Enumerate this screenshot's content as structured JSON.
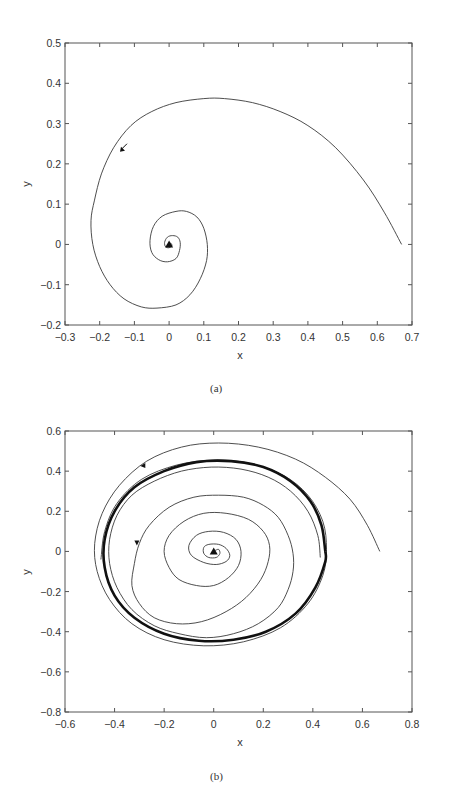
{
  "chart_data": [
    {
      "type": "line",
      "panel": "(a)",
      "title": "",
      "xlabel": "x",
      "ylabel": "y",
      "xlim": [
        -0.3,
        0.7
      ],
      "ylim": [
        -0.2,
        0.5
      ],
      "xticks": [
        -0.3,
        -0.2,
        -0.1,
        0,
        0.1,
        0.2,
        0.3,
        0.4,
        0.5,
        0.6,
        0.7
      ],
      "xtick_labels": [
        "−0.3",
        "−0.2",
        "−0.1",
        "0",
        "0.1",
        "0.2",
        "0.3",
        "0.4",
        "0.5",
        "0.6",
        "0.7"
      ],
      "yticks": [
        -0.2,
        -0.1,
        0,
        0.1,
        0.2,
        0.3,
        0.4,
        0.5
      ],
      "ytick_labels": [
        "−0.2",
        "−0.1",
        "0",
        "0.1",
        "0.2",
        "0.3",
        "0.4",
        "0.5"
      ],
      "grid": false,
      "legend": null,
      "series": [
        {
          "name": "trajectory (spiral to stable focus)",
          "style": "thin",
          "points": [
            [
              0.67,
              0.0
            ],
            [
              0.62,
              0.08
            ],
            [
              0.56,
              0.16
            ],
            [
              0.48,
              0.24
            ],
            [
              0.4,
              0.295
            ],
            [
              0.32,
              0.33
            ],
            [
              0.24,
              0.352
            ],
            [
              0.16,
              0.362
            ],
            [
              0.1,
              0.362
            ],
            [
              0.02,
              0.352
            ],
            [
              -0.05,
              0.33
            ],
            [
              -0.11,
              0.295
            ],
            [
              -0.16,
              0.24
            ],
            [
              -0.195,
              0.175
            ],
            [
              -0.215,
              0.11
            ],
            [
              -0.225,
              0.06
            ],
            [
              -0.22,
              0.0
            ],
            [
              -0.2,
              -0.055
            ],
            [
              -0.17,
              -0.1
            ],
            [
              -0.13,
              -0.135
            ],
            [
              -0.08,
              -0.155
            ],
            [
              -0.035,
              -0.158
            ],
            [
              0.02,
              -0.15
            ],
            [
              0.06,
              -0.125
            ],
            [
              0.09,
              -0.085
            ],
            [
              0.108,
              -0.04
            ],
            [
              0.11,
              0.0
            ],
            [
              0.1,
              0.04
            ],
            [
              0.08,
              0.068
            ],
            [
              0.05,
              0.082
            ],
            [
              0.02,
              0.082
            ],
            [
              -0.02,
              0.07
            ],
            [
              -0.045,
              0.045
            ],
            [
              -0.055,
              0.01
            ],
            [
              -0.05,
              -0.02
            ],
            [
              -0.03,
              -0.038
            ],
            [
              -0.005,
              -0.043
            ],
            [
              0.02,
              -0.035
            ],
            [
              0.03,
              -0.015
            ],
            [
              0.032,
              0.005
            ],
            [
              0.025,
              0.018
            ],
            [
              0.01,
              0.022
            ],
            [
              -0.005,
              0.018
            ],
            [
              -0.013,
              0.005
            ],
            [
              -0.01,
              -0.006
            ],
            [
              0.0,
              -0.008
            ],
            [
              0.008,
              -0.003
            ],
            [
              0.005,
              0.003
            ],
            [
              0.0,
              0.002
            ]
          ]
        }
      ],
      "markers": [
        {
          "type": "arrow",
          "at": [
            -0.13,
            0.24
          ],
          "direction": "down-left"
        },
        {
          "type": "triangle",
          "at": [
            0.0,
            0.0
          ],
          "label": "fixed point"
        }
      ]
    },
    {
      "type": "line",
      "panel": "(b)",
      "title": "",
      "xlabel": "x",
      "ylabel": "y",
      "xlim": [
        -0.6,
        0.8
      ],
      "ylim": [
        -0.8,
        0.6
      ],
      "xticks": [
        -0.6,
        -0.4,
        -0.2,
        0,
        0.2,
        0.4,
        0.6,
        0.8
      ],
      "xtick_labels": [
        "−0.6",
        "−0.4",
        "−0.2",
        "0",
        "0.2",
        "0.4",
        "0.6",
        "0.8"
      ],
      "yticks": [
        -0.8,
        -0.6,
        -0.4,
        -0.2,
        0,
        0.2,
        0.4,
        0.6
      ],
      "ytick_labels": [
        "−0.8",
        "−0.6",
        "−0.4",
        "−0.2",
        "0",
        "0.2",
        "0.4",
        "0.6"
      ],
      "grid": false,
      "legend": null,
      "series": [
        {
          "name": "outer trajectory (approaching limit cycle from outside)",
          "style": "thin",
          "points": [
            [
              0.67,
              0.0
            ],
            [
              0.62,
              0.13
            ],
            [
              0.55,
              0.26
            ],
            [
              0.45,
              0.37
            ],
            [
              0.33,
              0.46
            ],
            [
              0.18,
              0.52
            ],
            [
              0.02,
              0.54
            ],
            [
              -0.13,
              0.52
            ],
            [
              -0.27,
              0.45
            ],
            [
              -0.38,
              0.33
            ],
            [
              -0.45,
              0.19
            ],
            [
              -0.48,
              0.04
            ],
            [
              -0.47,
              -0.1
            ],
            [
              -0.42,
              -0.24
            ],
            [
              -0.33,
              -0.36
            ],
            [
              -0.2,
              -0.44
            ],
            [
              -0.04,
              -0.47
            ],
            [
              0.12,
              -0.45
            ],
            [
              0.27,
              -0.38
            ],
            [
              0.38,
              -0.26
            ],
            [
              0.44,
              -0.12
            ],
            [
              0.455,
              0.01
            ],
            [
              0.44,
              0.15
            ],
            [
              0.38,
              0.28
            ],
            [
              0.28,
              0.38
            ],
            [
              0.14,
              0.44
            ],
            [
              0.0,
              0.455
            ],
            [
              -0.15,
              0.43
            ],
            [
              -0.29,
              0.36
            ],
            [
              -0.39,
              0.24
            ],
            [
              -0.44,
              0.1
            ],
            [
              -0.455,
              -0.04
            ]
          ]
        },
        {
          "name": "stable limit cycle",
          "style": "thick",
          "points": [
            [
              0.45,
              0.0
            ],
            [
              0.435,
              0.13
            ],
            [
              0.39,
              0.25
            ],
            [
              0.31,
              0.35
            ],
            [
              0.2,
              0.42
            ],
            [
              0.07,
              0.45
            ],
            [
              -0.07,
              0.445
            ],
            [
              -0.2,
              0.4
            ],
            [
              -0.32,
              0.32
            ],
            [
              -0.4,
              0.2
            ],
            [
              -0.44,
              0.06
            ],
            [
              -0.44,
              -0.08
            ],
            [
              -0.4,
              -0.22
            ],
            [
              -0.32,
              -0.33
            ],
            [
              -0.2,
              -0.41
            ],
            [
              -0.06,
              -0.445
            ],
            [
              0.08,
              -0.44
            ],
            [
              0.21,
              -0.4
            ],
            [
              0.33,
              -0.31
            ],
            [
              0.41,
              -0.18
            ],
            [
              0.45,
              -0.05
            ],
            [
              0.45,
              0.0
            ]
          ]
        },
        {
          "name": "inner trajectory (spiral out from unstable focus)",
          "style": "thin",
          "points": [
            [
              0.0,
              0.0
            ],
            [
              0.008,
              0.006
            ],
            [
              0.02,
              0.01
            ],
            [
              0.025,
              -0.01
            ],
            [
              0.01,
              -0.03
            ],
            [
              -0.02,
              -0.03
            ],
            [
              -0.04,
              -0.01
            ],
            [
              -0.04,
              0.02
            ],
            [
              -0.02,
              0.035
            ],
            [
              0.02,
              0.035
            ],
            [
              0.05,
              0.015
            ],
            [
              0.065,
              -0.02
            ],
            [
              0.05,
              -0.05
            ],
            [
              0.01,
              -0.065
            ],
            [
              -0.04,
              -0.055
            ],
            [
              -0.09,
              -0.02
            ],
            [
              -0.1,
              0.03
            ],
            [
              -0.07,
              0.08
            ],
            [
              -0.02,
              0.1
            ],
            [
              0.04,
              0.095
            ],
            [
              0.09,
              0.06
            ],
            [
              0.11,
              0.0
            ],
            [
              0.1,
              -0.07
            ],
            [
              0.06,
              -0.13
            ],
            [
              0.0,
              -0.17
            ],
            [
              -0.07,
              -0.17
            ],
            [
              -0.14,
              -0.14
            ],
            [
              -0.18,
              -0.08
            ],
            [
              -0.2,
              0.0
            ],
            [
              -0.18,
              0.08
            ],
            [
              -0.12,
              0.15
            ],
            [
              -0.04,
              0.19
            ],
            [
              0.05,
              0.19
            ],
            [
              0.14,
              0.16
            ],
            [
              0.2,
              0.1
            ],
            [
              0.225,
              0.03
            ],
            [
              0.22,
              -0.05
            ],
            [
              0.19,
              -0.14
            ],
            [
              0.13,
              -0.23
            ],
            [
              0.05,
              -0.3
            ],
            [
              -0.05,
              -0.35
            ],
            [
              -0.15,
              -0.36
            ],
            [
              -0.24,
              -0.33
            ],
            [
              -0.3,
              -0.26
            ],
            [
              -0.33,
              -0.17
            ],
            [
              -0.32,
              -0.06
            ],
            [
              -0.3,
              0.04
            ],
            [
              -0.26,
              0.13
            ],
            [
              -0.18,
              0.22
            ],
            [
              -0.08,
              0.27
            ],
            [
              0.02,
              0.28
            ],
            [
              0.12,
              0.27
            ],
            [
              0.2,
              0.23
            ],
            [
              0.26,
              0.17
            ],
            [
              0.3,
              0.08
            ],
            [
              0.32,
              -0.01
            ],
            [
              0.32,
              -0.1
            ],
            [
              0.3,
              -0.19
            ],
            [
              0.26,
              -0.28
            ],
            [
              0.18,
              -0.36
            ],
            [
              0.08,
              -0.41
            ],
            [
              -0.03,
              -0.43
            ],
            [
              -0.14,
              -0.41
            ],
            [
              -0.24,
              -0.37
            ],
            [
              -0.33,
              -0.29
            ],
            [
              -0.39,
              -0.18
            ],
            [
              -0.42,
              -0.06
            ],
            [
              -0.42,
              0.06
            ],
            [
              -0.39,
              0.18
            ],
            [
              -0.33,
              0.28
            ],
            [
              -0.24,
              0.35
            ],
            [
              -0.13,
              0.4
            ],
            [
              -0.01,
              0.42
            ],
            [
              0.11,
              0.41
            ],
            [
              0.22,
              0.37
            ],
            [
              0.31,
              0.3
            ],
            [
              0.38,
              0.2
            ],
            [
              0.42,
              0.08
            ],
            [
              0.43,
              -0.03
            ]
          ]
        }
      ],
      "markers": [
        {
          "type": "arrow",
          "at": [
            -0.28,
            0.43
          ],
          "direction": "left"
        },
        {
          "type": "arrow",
          "at": [
            -0.31,
            0.05
          ],
          "direction": "down"
        },
        {
          "type": "triangle",
          "at": [
            0.0,
            0.0
          ],
          "label": "fixed point"
        }
      ]
    }
  ],
  "panels": [
    {
      "caption": "(a)",
      "xlabel": "x",
      "ylabel": "y"
    },
    {
      "caption": "(b)",
      "xlabel": "x",
      "ylabel": "y"
    }
  ],
  "colors": {
    "line": "#3a3a3a",
    "thick_line": "#111111",
    "axis": "#555555",
    "text": "#333333"
  }
}
